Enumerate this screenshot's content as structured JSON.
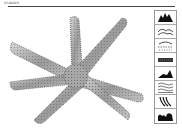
{
  "header": {
    "title": "vrauon"
  },
  "canvas": {
    "subject": "starfish-illustration"
  },
  "palette": {
    "items": [
      {
        "name": "mountain-peaks-texture"
      },
      {
        "name": "hills-dots-texture"
      },
      {
        "name": "scattered-dots-texture"
      },
      {
        "name": "brick-band-texture"
      },
      {
        "name": "hill-silhouette-texture"
      },
      {
        "name": "waves-lines-texture"
      },
      {
        "name": "curved-strokes-texture"
      },
      {
        "name": "bushes-silhouette-texture"
      }
    ]
  }
}
